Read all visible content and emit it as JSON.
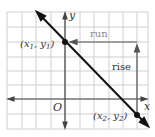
{
  "diagram": {
    "colors": {
      "grid": "#cfcfcf",
      "axis": "#444444",
      "line": "#111111",
      "run_rise": "#555555",
      "label": "#333333",
      "run_label": "#888888"
    },
    "axes": {
      "x_label": "x",
      "y_label": "y",
      "origin_label": "O"
    },
    "points": [
      {
        "id": "p1",
        "label_parts": [
          "(x",
          "1",
          ", y",
          "1",
          ")"
        ],
        "label": "(x1, y1)"
      },
      {
        "id": "p2",
        "label_parts": [
          "(x",
          "2",
          ", y",
          "2",
          ")"
        ],
        "label": "(x2, y2)"
      }
    ],
    "run_label": "run",
    "rise_label": "rise"
  }
}
